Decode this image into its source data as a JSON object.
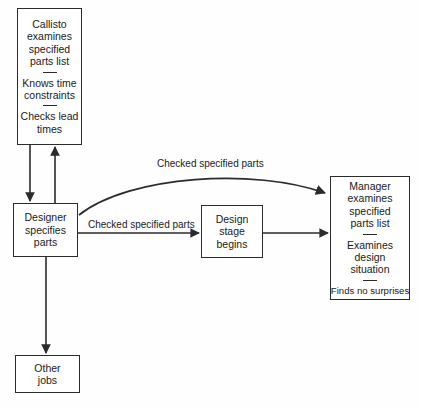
{
  "diagram": {
    "background_color": "#fefefe",
    "line_color": "#2b2b2b",
    "text_color": "#1a1a1a"
  },
  "nodes": {
    "callisto": {
      "lines": [
        "Callisto",
        "examines",
        "specified",
        "parts list"
      ],
      "section2": [
        "Knows time",
        "constraints"
      ],
      "section3": [
        "Checks lead",
        "times"
      ]
    },
    "designer": {
      "lines": [
        "Designer",
        "specifies",
        "parts"
      ]
    },
    "other_jobs": {
      "lines": [
        "Other",
        "jobs"
      ]
    },
    "design_stage": {
      "lines": [
        "Design",
        "stage",
        "begins"
      ]
    },
    "manager": {
      "section1": [
        "Manager",
        "examines",
        "specified",
        "parts list"
      ],
      "section2": [
        "Examines",
        "design",
        "situation"
      ],
      "section3": [
        "Finds no surprises"
      ]
    }
  },
  "edges": {
    "curve_label": "Checked specified parts",
    "straight_label": "Checked specified parts"
  }
}
